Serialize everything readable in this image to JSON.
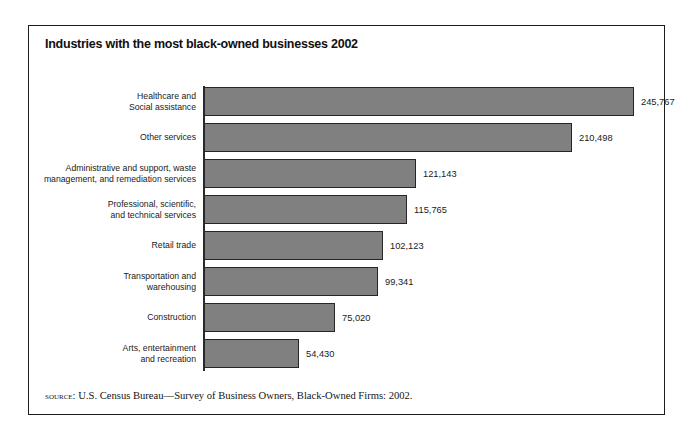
{
  "title": "Industries with the most black-owned businesses 2002",
  "source": {
    "label": "source:",
    "text": " U.S. Census Bureau—Survey of  Business Owners, Black-Owned Firms: 2002."
  },
  "style": {
    "bar_fill": "#808080",
    "bar_border": "#262626",
    "axis_color": "#2a2a2a",
    "frame_color": "#1c1c1c",
    "text_color": "#1a1a1a"
  },
  "chart_data": {
    "type": "bar",
    "orientation": "horizontal",
    "title": "Industries with the most black-owned businesses 2002",
    "xlabel": "",
    "ylabel": "",
    "grid": false,
    "legend": "none",
    "xlim": [
      0,
      245767
    ],
    "categories": [
      "Healthcare and\nSocial assistance",
      "Other services",
      "Administrative and support, waste\nmanagement, and remediation services",
      "Professional, scientific,\nand technical services",
      "Retail trade",
      "Transportation and\nwarehousing",
      "Construction",
      "Arts, entertainment\nand recreation"
    ],
    "values": [
      245767,
      210498,
      121143,
      115765,
      102123,
      99341,
      75020,
      54430
    ],
    "value_labels": [
      "245,767",
      "210,498",
      "121,143",
      "115,765",
      "102,123",
      "99,341",
      "75,020",
      "54,430"
    ]
  }
}
